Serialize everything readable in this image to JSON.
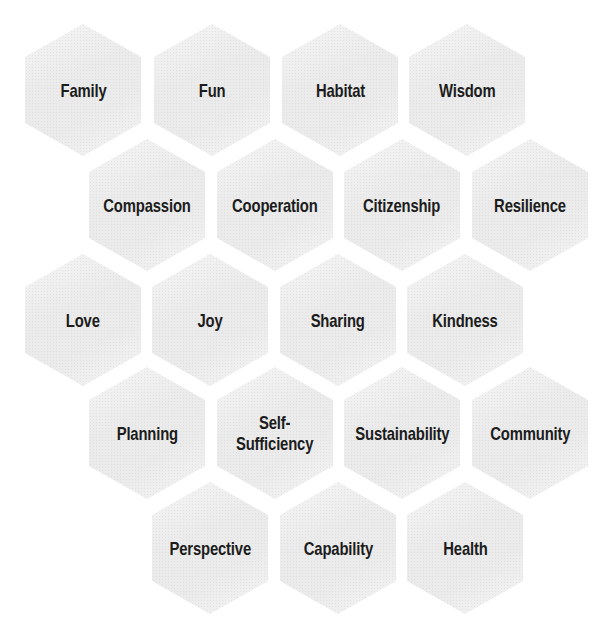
{
  "diagram": {
    "type": "hexagon-grid",
    "colors": {
      "background": "#ffffff",
      "hex_fill": "#ebebeb",
      "text": "#1c1c1c"
    },
    "rows": [
      {
        "cells": [
          {
            "label": "Family",
            "x": 83,
            "y": 90
          },
          {
            "label": "Fun",
            "x": 212,
            "y": 90
          },
          {
            "label": "Habitat",
            "x": 340,
            "y": 90
          },
          {
            "label": "Wisdom",
            "x": 467,
            "y": 90
          }
        ]
      },
      {
        "cells": [
          {
            "label": "Compassion",
            "x": 147,
            "y": 205
          },
          {
            "label": "Cooperation",
            "x": 275,
            "y": 205
          },
          {
            "label": "Citizenship",
            "x": 402,
            "y": 205
          },
          {
            "label": "Resilience",
            "x": 530,
            "y": 205
          }
        ]
      },
      {
        "cells": [
          {
            "label": "Love",
            "x": 83,
            "y": 320
          },
          {
            "label": "Joy",
            "x": 210,
            "y": 320
          },
          {
            "label": "Sharing",
            "x": 338,
            "y": 320
          },
          {
            "label": "Kindness",
            "x": 465,
            "y": 320
          }
        ]
      },
      {
        "cells": [
          {
            "label": "Planning",
            "x": 147,
            "y": 433
          },
          {
            "label": "Self-\nSufficiency",
            "x": 275,
            "y": 433
          },
          {
            "label": "Sustainability",
            "x": 402,
            "y": 433
          },
          {
            "label": "Community",
            "x": 530,
            "y": 433
          }
        ]
      },
      {
        "cells": [
          {
            "label": "Perspective",
            "x": 210,
            "y": 548
          },
          {
            "label": "Capability",
            "x": 338,
            "y": 548
          },
          {
            "label": "Health",
            "x": 465,
            "y": 548
          }
        ]
      }
    ]
  }
}
